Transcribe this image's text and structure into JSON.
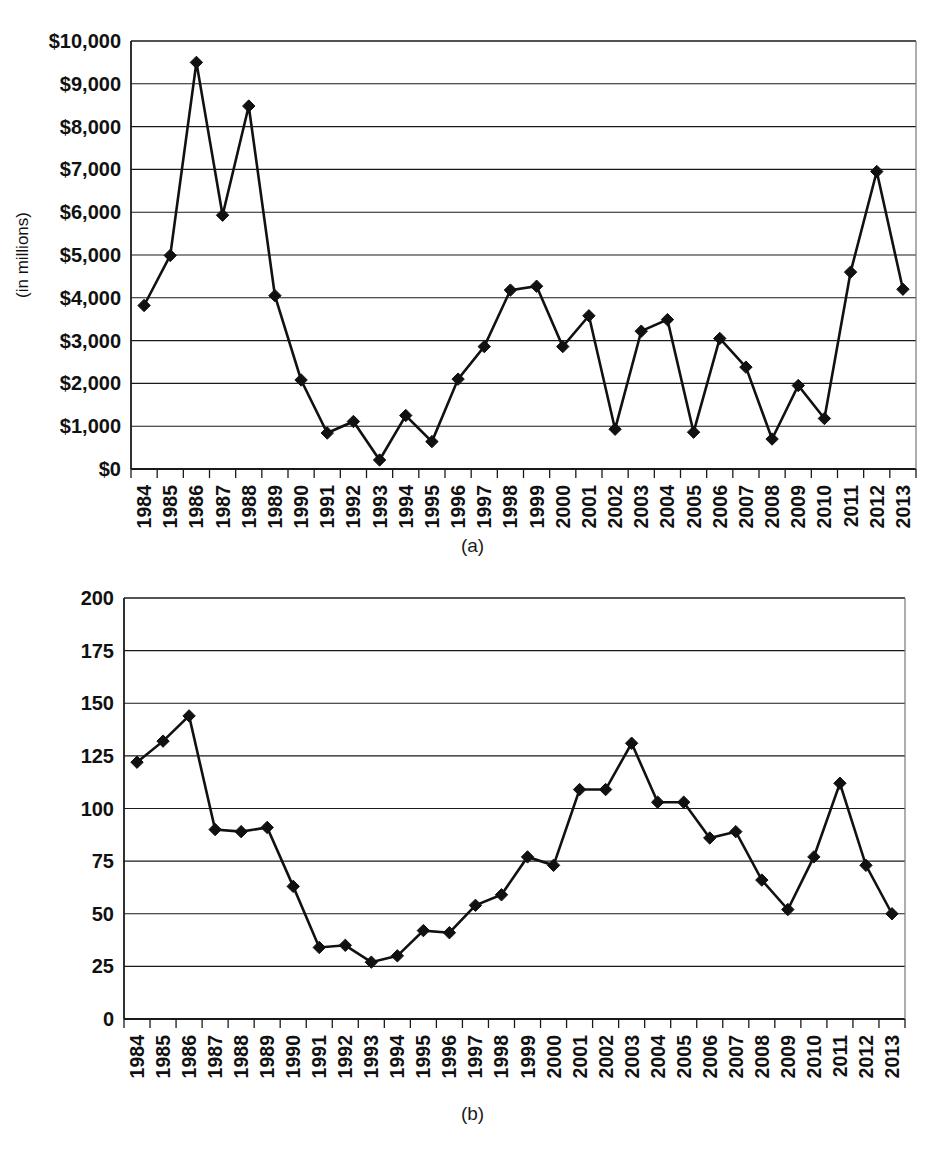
{
  "figure": {
    "caption_a": "(a)",
    "caption_b": "(b)"
  },
  "chart_data": [
    {
      "id": "chart-a",
      "type": "line",
      "title": "",
      "xlabel": "",
      "ylabel": "(in millions)",
      "ylim": [
        0,
        10000
      ],
      "ytick_step": 1000,
      "grid": true,
      "legend": "none",
      "marker": "diamond",
      "ytick_labels": [
        "$0",
        "$1,000",
        "$2,000",
        "$3,000",
        "$4,000",
        "$5,000",
        "$6,000",
        "$7,000",
        "$8,000",
        "$9,000",
        "$10,000"
      ],
      "categories": [
        "1984",
        "1985",
        "1986",
        "1987",
        "1988",
        "1989",
        "1990",
        "1991",
        "1992",
        "1993",
        "1994",
        "1995",
        "1996",
        "1997",
        "1998",
        "1999",
        "2000",
        "2001",
        "2002",
        "2003",
        "2004",
        "2005",
        "2006",
        "2007",
        "2008",
        "2009",
        "2010",
        "2011",
        "2012",
        "2013"
      ],
      "values": [
        3820,
        4990,
        9500,
        5930,
        8480,
        4050,
        2080,
        840,
        1110,
        210,
        1250,
        640,
        2100,
        2860,
        4180,
        4270,
        2860,
        3580,
        930,
        3220,
        3490,
        860,
        3050,
        2380,
        700,
        1950,
        1180,
        4600,
        6950,
        4200
      ]
    },
    {
      "id": "chart-b",
      "type": "line",
      "title": "",
      "xlabel": "",
      "ylabel": "",
      "ylim": [
        0,
        200
      ],
      "ytick_step": 25,
      "grid": true,
      "legend": "none",
      "marker": "diamond",
      "ytick_labels": [
        "0",
        "25",
        "50",
        "75",
        "100",
        "125",
        "150",
        "175",
        "200"
      ],
      "categories": [
        "1984",
        "1985",
        "1986",
        "1987",
        "1988",
        "1989",
        "1990",
        "1991",
        "1992",
        "1993",
        "1994",
        "1995",
        "1996",
        "1997",
        "1998",
        "1999",
        "2000",
        "2001",
        "2002",
        "2003",
        "2004",
        "2005",
        "2006",
        "2007",
        "2008",
        "2009",
        "2010",
        "2011",
        "2012",
        "2013"
      ],
      "values": [
        122,
        132,
        144,
        90,
        89,
        91,
        63,
        34,
        35,
        27,
        30,
        42,
        41,
        54,
        59,
        77,
        73,
        109,
        109,
        131,
        103,
        103,
        86,
        89,
        66,
        52,
        77,
        112,
        73,
        50
      ]
    }
  ]
}
